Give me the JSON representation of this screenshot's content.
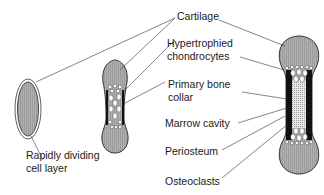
{
  "diagram": {
    "labels": {
      "cartilage": "Cartilage",
      "hypertrophied_1": "Hypertrophied",
      "hypertrophied_2": "chondrocytes",
      "primary_collar_1": "Primary bone",
      "primary_collar_2": "collar",
      "marrow_cavity": "Marrow cavity",
      "periosteum": "Periosteum",
      "osteoclasts": "Osteoclasts",
      "rapid_1": "Rapidly dividing",
      "rapid_2": "cell layer"
    },
    "stages": [
      {
        "name": "cartilage-model",
        "description": "Oval cartilage with rapidly dividing cell layer"
      },
      {
        "name": "early-bone",
        "description": "Elongated cartilage with hypertrophied chondrocytes and primary bone collar"
      },
      {
        "name": "later-bone",
        "description": "Bone with marrow cavity, periosteum and osteoclasts"
      }
    ],
    "colors": {
      "cartilage_fill": "#a8a8a8",
      "outline": "#222222",
      "collar": "#111111",
      "marrow": "#e6e6e6",
      "cell": "#ffffff",
      "leader_line": "#333333"
    }
  }
}
